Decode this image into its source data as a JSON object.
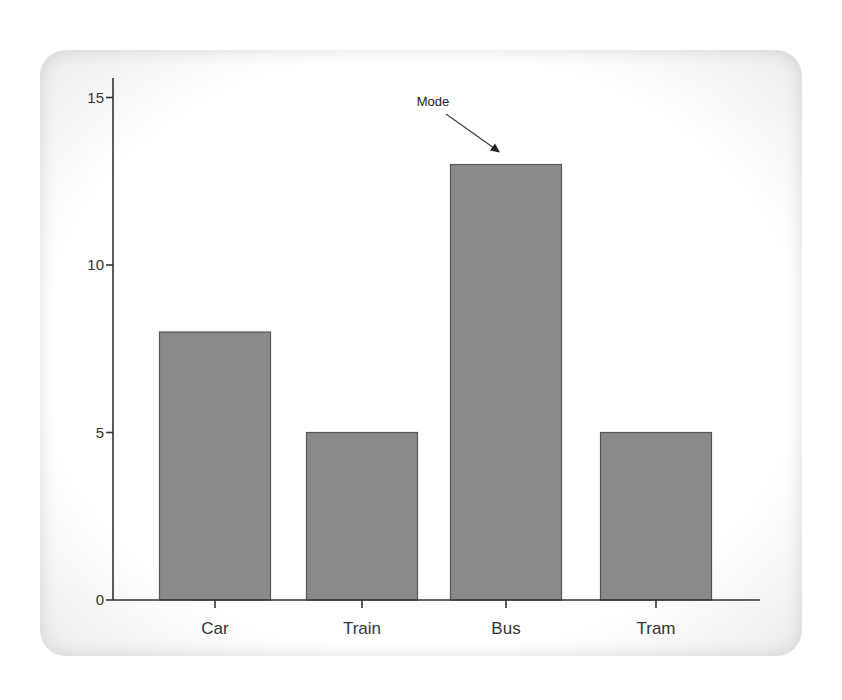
{
  "chart_data": {
    "type": "bar",
    "title": "",
    "xlabel": "",
    "ylabel": "",
    "categories": [
      "Car",
      "Train",
      "Bus",
      "Tram"
    ],
    "values": [
      8,
      5,
      13,
      5
    ],
    "ylim": [
      0,
      15.5
    ],
    "yticks": [
      0,
      5,
      10,
      15
    ],
    "grid": false,
    "legend": null,
    "bar_color": "#8a8a8a",
    "annotations": [
      {
        "text": "Mode",
        "target": "Bus",
        "arrow": true
      }
    ]
  }
}
